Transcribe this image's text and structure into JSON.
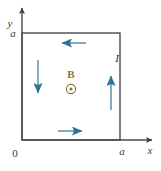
{
  "figure": {
    "background_color": "#ffffff"
  },
  "axes": {
    "x_axis_label": "x",
    "y_axis_label": "y",
    "origin_label": "0",
    "x_tick_label": "a",
    "y_tick_label": "a",
    "axis_color": "#4a4a4a"
  },
  "loop": {
    "shape": "square",
    "side_label": "a",
    "outline_color": "#4a4a4a",
    "current_label": "I",
    "current_direction": "counterclockwise",
    "current_arrow_color": "#2d7496",
    "segments": [
      {
        "name": "top-segment",
        "arrow_direction": "left"
      },
      {
        "name": "left-segment",
        "arrow_direction": "down"
      },
      {
        "name": "bottom-segment",
        "arrow_direction": "right"
      },
      {
        "name": "right-segment",
        "arrow_direction": "up"
      }
    ]
  },
  "field": {
    "label": "B",
    "symbol": "out-of-page-dot",
    "color": "#8a7433",
    "description": "out of page"
  }
}
